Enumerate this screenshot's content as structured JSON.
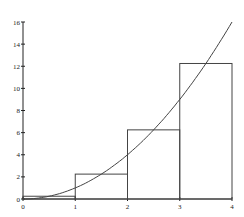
{
  "chart_data": {
    "type": "line",
    "title": "",
    "xlabel": "",
    "ylabel": "",
    "xlim": [
      0,
      4
    ],
    "ylim": [
      0,
      16
    ],
    "grid": false,
    "legend": null,
    "x_ticks": [
      "0",
      "1",
      "2",
      "3",
      "4"
    ],
    "y_ticks": [
      "0",
      "2",
      "4",
      "6",
      "8",
      "10",
      "12",
      "14",
      "16"
    ],
    "series": [
      {
        "name": "curve y = x^2",
        "kind": "line",
        "x": [
          0,
          0.5,
          1,
          1.5,
          2,
          2.5,
          3,
          3.5,
          4
        ],
        "values": [
          0,
          0.25,
          1,
          2.25,
          4,
          6.25,
          9,
          12.25,
          16
        ]
      },
      {
        "name": "midpoint rectangles",
        "kind": "step",
        "intervals": [
          [
            0,
            1
          ],
          [
            1,
            2
          ],
          [
            2,
            3
          ],
          [
            3,
            4
          ]
        ],
        "values": [
          0.25,
          2.25,
          6.25,
          12.25
        ]
      }
    ],
    "colors": {
      "line": "#333333",
      "axis": "#222222"
    }
  }
}
